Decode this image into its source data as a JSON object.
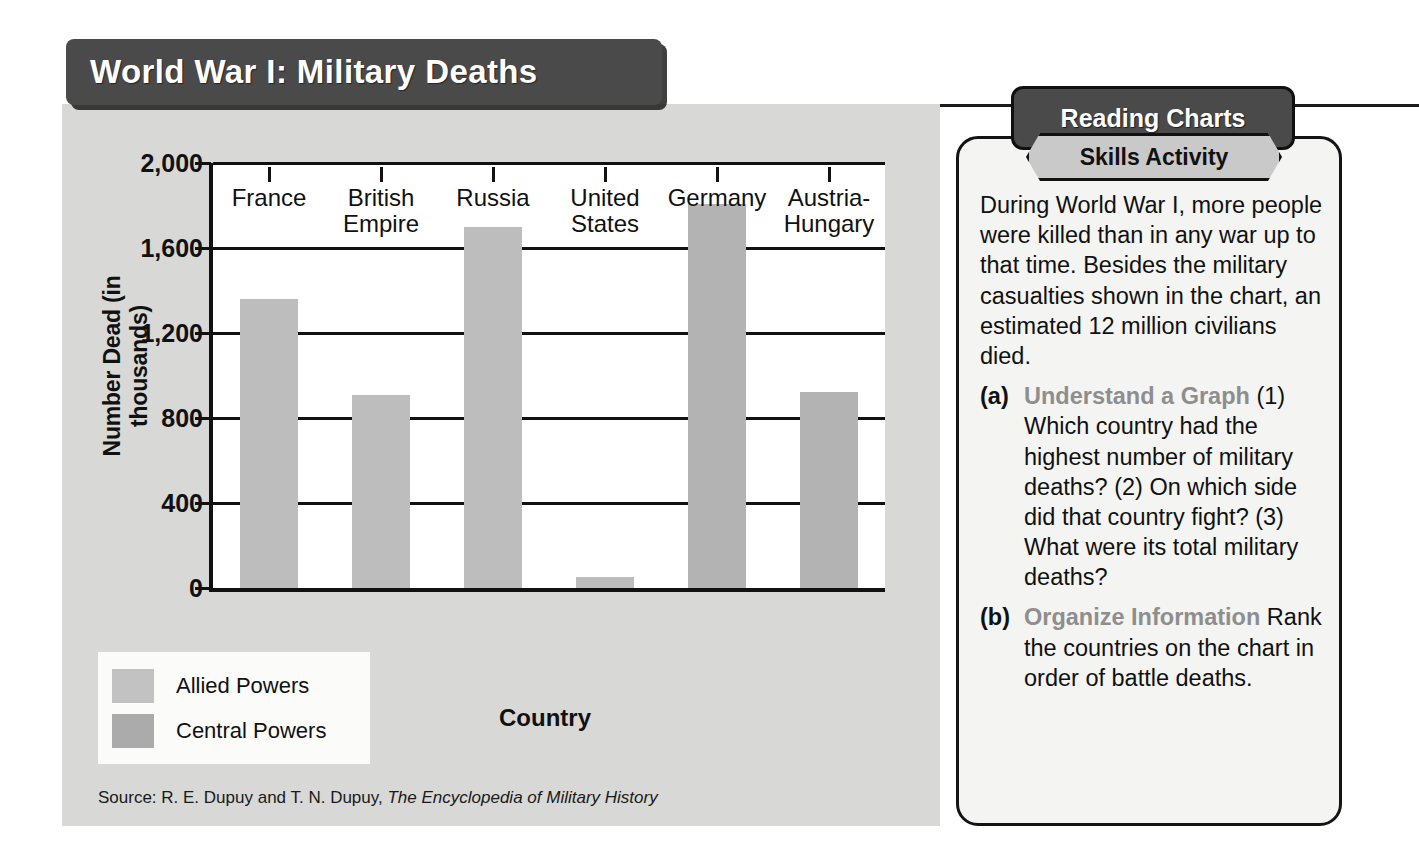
{
  "chart_panel": {
    "title": "World War I: Military Deaths",
    "source_prefix": "Source: R. E. Dupuy and T. N. Dupuy, ",
    "source_italic": "The Encyclopedia of Military History"
  },
  "chart_data": {
    "type": "bar",
    "title": "World War I: Military Deaths",
    "xlabel": "Country",
    "ylabel": "Number Dead (in thousands)",
    "categories": [
      "France",
      "British Empire",
      "Russia",
      "United States",
      "Germany",
      "Austria-Hungary"
    ],
    "category_lines": [
      [
        "France"
      ],
      [
        "British",
        "Empire"
      ],
      [
        "Russia"
      ],
      [
        "United",
        "States"
      ],
      [
        "Germany"
      ],
      [
        "Austria-",
        "Hungary"
      ]
    ],
    "values": [
      1360,
      908,
      1700,
      50,
      1808,
      922
    ],
    "series_of": [
      "Allied Powers",
      "Allied Powers",
      "Allied Powers",
      "Allied Powers",
      "Central Powers",
      "Central Powers"
    ],
    "ylim": [
      0,
      2000
    ],
    "yticks": [
      0,
      400,
      800,
      1200,
      1600,
      2000
    ],
    "ytick_labels": [
      "0",
      "400",
      "800",
      "1,200",
      "1,600",
      "2,000"
    ],
    "grid": true,
    "legend_position": "below-left",
    "legend": [
      {
        "label": "Allied Powers",
        "color": "#c2c2c2"
      },
      {
        "label": "Central Powers",
        "color": "#ababab"
      }
    ]
  },
  "sidebar": {
    "banner_top": "Reading Charts",
    "banner_sub": "Skills Activity",
    "intro": "During World War I, more people were killed than in any war up to that time. Besides the military casualties shown in the chart, an estimated 12 million civilians died.",
    "questions": [
      {
        "marker": "(a)",
        "head": "Understand a Graph",
        "text": "(1) Which country had the highest number of military deaths? (2) On which side did that country fight? (3) What were its total military deaths?"
      },
      {
        "marker": "(b)",
        "head": "Organize Information",
        "text": "Rank the countries on the chart in order of battle deaths."
      }
    ]
  },
  "colors": {
    "banner_dark": "#4a4a4a",
    "panel_bg": "#d8d8d6",
    "allied": "#bdbdbd",
    "central": "#b3b3b3",
    "question_head": "#8e8e8e"
  }
}
